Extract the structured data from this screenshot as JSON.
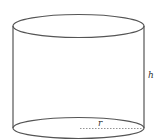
{
  "diagram": {
    "type": "cylinder",
    "labels": {
      "height": "h",
      "radius": "r"
    },
    "colors": {
      "stroke": "#555555",
      "dashed": "#777777",
      "text": "#333333",
      "background": "#ffffff"
    }
  }
}
